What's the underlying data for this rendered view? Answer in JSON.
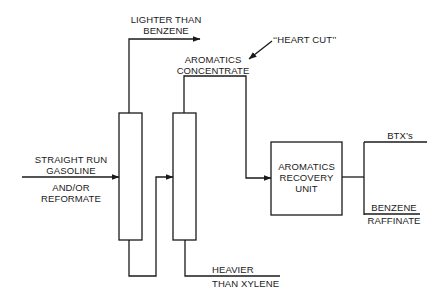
{
  "diagram": {
    "title": "",
    "nodes": [
      {
        "id": "column-1",
        "label": "",
        "type": "distillation-column"
      },
      {
        "id": "column-2",
        "label": "",
        "type": "distillation-column"
      },
      {
        "id": "recovery-unit",
        "label_lines": [
          "AROMATICS",
          "RECOVERY",
          "UNIT"
        ],
        "type": "unit-box"
      }
    ],
    "labels": {
      "feed_line1": "STRAIGHT RUN",
      "feed_line2": "GASOLINE",
      "feed_line3": "AND/OR",
      "feed_line4": "REFORMATE",
      "lighter_line1": "LIGHTER THAN",
      "lighter_line2": "BENZENE",
      "heart_cut": "‘‘HEART CUT’’",
      "aromatics_line1": "AROMATICS",
      "aromatics_line2": "CONCENTRATE",
      "recovery_line1": "AROMATICS",
      "recovery_line2": "RECOVERY",
      "recovery_line3": "UNIT",
      "btx": "BTX’s",
      "raffinate_line1": "BENZENE",
      "raffinate_line2": "RAFFINATE",
      "heavier_line1": "HEAVIER",
      "heavier_line2": "THAN XYLENE"
    },
    "edges": [
      {
        "from": "feed",
        "to": "column-1",
        "label": "STRAIGHT RUN GASOLINE AND/OR REFORMATE"
      },
      {
        "from": "column-1",
        "to": "overhead",
        "label": "LIGHTER THAN BENZENE"
      },
      {
        "from": "column-1",
        "to": "column-2",
        "label": ""
      },
      {
        "from": "column-2",
        "to": "recovery-unit",
        "label": "AROMATICS CONCENTRATE (\"HEART CUT\")"
      },
      {
        "from": "column-2",
        "to": "bottoms",
        "label": "HEAVIER THAN XYLENE"
      },
      {
        "from": "recovery-unit",
        "to": "btx",
        "label": "BTX's"
      },
      {
        "from": "recovery-unit",
        "to": "raffinate",
        "label": "BENZENE RAFFINATE"
      }
    ],
    "colors": {
      "line": "#1a1a1a",
      "background": "#ffffff"
    }
  }
}
